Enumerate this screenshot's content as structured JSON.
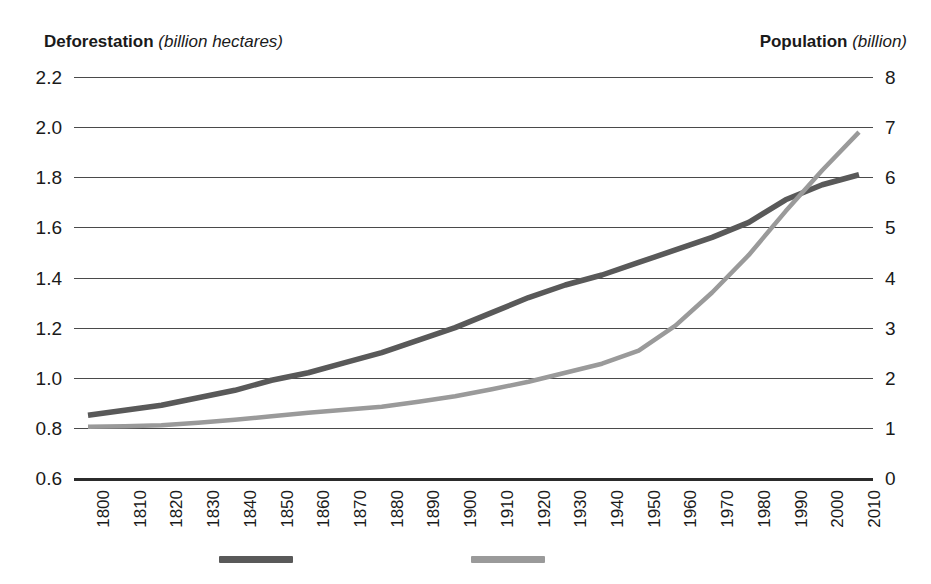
{
  "left_axis": {
    "title_strong": "Deforestation",
    "title_units": "(billion hectares)",
    "ticks": [
      "2.2",
      "2.0",
      "1.8",
      "1.6",
      "1.4",
      "1.2",
      "1.0",
      "0.8",
      "0.6"
    ]
  },
  "right_axis": {
    "title_strong": "Population",
    "title_units": "(billion)",
    "ticks": [
      "8",
      "7",
      "6",
      "5",
      "4",
      "3",
      "2",
      "1",
      "0"
    ]
  },
  "x_axis": {
    "ticks": [
      "1800",
      "1810",
      "1820",
      "1830",
      "1840",
      "1850",
      "1860",
      "1870",
      "1880",
      "1890",
      "1900",
      "1910",
      "1920",
      "1930",
      "1940",
      "1950",
      "1960",
      "1970",
      "1980",
      "1990",
      "2000",
      "2010"
    ]
  },
  "legend": {
    "items": [
      {
        "label": "",
        "color": "#595959",
        "name": "deforestation"
      },
      {
        "label": "",
        "color": "#9a9a9a",
        "name": "population"
      }
    ]
  },
  "colors": {
    "deforestation_line": "#595959",
    "population_line": "#9a9a9a",
    "gridline": "#4a4a4a",
    "baseline": "#2b2b2b",
    "text": "#1a1a1a"
  },
  "chart_data": {
    "type": "line",
    "title": "",
    "xlabel": "",
    "grid": true,
    "legend_position": "bottom",
    "x": [
      1800,
      1810,
      1820,
      1830,
      1840,
      1850,
      1860,
      1870,
      1880,
      1890,
      1900,
      1910,
      1920,
      1930,
      1940,
      1950,
      1960,
      1970,
      1980,
      1990,
      2000,
      2010
    ],
    "xlim": [
      1800,
      2010
    ],
    "y_axes": [
      {
        "id": "left",
        "label": "Deforestation (billion hectares)",
        "ylim": [
          0.6,
          2.2
        ],
        "ticks": [
          0.6,
          0.8,
          1.0,
          1.2,
          1.4,
          1.6,
          1.8,
          2.0,
          2.2
        ]
      },
      {
        "id": "right",
        "label": "Population (billion)",
        "ylim": [
          0,
          8
        ],
        "ticks": [
          0,
          1,
          2,
          3,
          4,
          5,
          6,
          7,
          8
        ]
      }
    ],
    "series": [
      {
        "name": "Deforestation",
        "axis": "left",
        "ylabel": "Deforestation (billion hectares)",
        "color": "#595959",
        "values": [
          0.85,
          0.87,
          0.89,
          0.92,
          0.95,
          0.99,
          1.02,
          1.06,
          1.1,
          1.15,
          1.2,
          1.26,
          1.32,
          1.37,
          1.41,
          1.46,
          1.51,
          1.56,
          1.62,
          1.71,
          1.77,
          1.81
        ]
      },
      {
        "name": "Population",
        "axis": "right",
        "ylabel": "Population (billion)",
        "color": "#9a9a9a",
        "values": [
          1.02,
          1.03,
          1.05,
          1.1,
          1.16,
          1.23,
          1.3,
          1.36,
          1.42,
          1.52,
          1.63,
          1.77,
          1.92,
          2.1,
          2.28,
          2.54,
          3.04,
          3.7,
          4.45,
          5.32,
          6.14,
          6.9
        ]
      }
    ]
  }
}
